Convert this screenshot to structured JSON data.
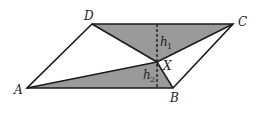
{
  "figure": {
    "type": "parallelogram-diagram",
    "vertices": {
      "A": {
        "label": "A",
        "x": 27,
        "y": 88
      },
      "B": {
        "label": "B",
        "x": 173,
        "y": 88
      },
      "C": {
        "label": "C",
        "x": 233,
        "y": 24
      },
      "D": {
        "label": "D",
        "x": 92,
        "y": 24
      },
      "X": {
        "label": "X",
        "x": 157,
        "y": 62
      }
    },
    "heights": {
      "h1": {
        "label": "h",
        "sub": "1"
      },
      "h2": {
        "label": "h",
        "sub": "2"
      }
    },
    "shaded_triangles": [
      "DCX",
      "ABX"
    ],
    "colors": {
      "shade": "#9a9a9a",
      "stroke": "#1a1a1a",
      "background": "#ffffff"
    }
  }
}
